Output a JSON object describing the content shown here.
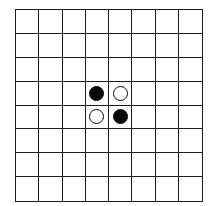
{
  "board": {
    "rows": 8,
    "cols": 8,
    "line_color": "#1a1a1a",
    "background": "#ffffff",
    "pieces": [
      {
        "row": 3,
        "col": 3,
        "color": "black"
      },
      {
        "row": 3,
        "col": 4,
        "color": "white"
      },
      {
        "row": 4,
        "col": 3,
        "color": "white"
      },
      {
        "row": 4,
        "col": 4,
        "color": "black"
      }
    ]
  },
  "colors": {
    "black_piece": "#0a0a0a",
    "white_piece": "#ffffff"
  }
}
